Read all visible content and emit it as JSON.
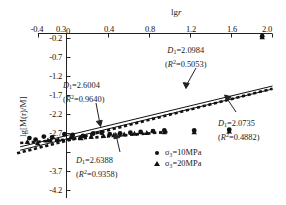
{
  "chart_data": {
    "type": "scatter",
    "title": "",
    "xlabel": "lgr",
    "ylabel": "lg[M(r)/M]",
    "xlim": [
      -0.55,
      2.05
    ],
    "ylim": [
      -4.2,
      -0.2
    ],
    "grid": false,
    "legend_position": "bottom-center-right",
    "xticks": [
      "-0.4",
      "0.3",
      "0",
      "0.4",
      "0.8",
      "1.2",
      "1.6",
      "2.0"
    ],
    "xtick_values": [
      -0.4,
      0.3,
      0.0,
      0.4,
      0.8,
      1.2,
      1.6,
      2.0
    ],
    "yticks": [
      "-0.2",
      "-0.7",
      "-1.2",
      "-1.7",
      "-2.2",
      "-2.7",
      "-3.2",
      "-3.7",
      "-4.2"
    ],
    "ytick_values": [
      -0.2,
      -0.7,
      -1.2,
      -1.7,
      -2.2,
      -2.7,
      -3.2,
      -3.7,
      -4.2
    ],
    "series": [
      {
        "name": "σ₃=10MPa",
        "marker": "circle",
        "points": [
          [
            -0.36,
            -2.82
          ],
          [
            -0.3,
            -2.86
          ],
          [
            -0.22,
            -2.78
          ],
          [
            -0.14,
            -2.8
          ],
          [
            -0.02,
            -2.72
          ],
          [
            0.06,
            -2.74
          ],
          [
            0.16,
            -2.76
          ],
          [
            0.26,
            -2.7
          ],
          [
            0.34,
            -2.68
          ],
          [
            0.42,
            -2.72
          ],
          [
            0.52,
            -2.7
          ],
          [
            0.62,
            -2.68
          ],
          [
            0.72,
            -2.66
          ],
          [
            0.84,
            -2.64
          ],
          [
            0.95,
            -2.62
          ],
          [
            1.24,
            -2.62
          ],
          [
            1.58,
            -2.6
          ],
          [
            1.9,
            -0.14
          ]
        ]
      },
      {
        "name": "σ₃=20MPa",
        "marker": "triangle",
        "points": [
          [
            -0.38,
            -2.92
          ],
          [
            -0.28,
            -2.95
          ],
          [
            -0.18,
            -2.88
          ],
          [
            -0.08,
            -2.86
          ],
          [
            0.04,
            -2.8
          ],
          [
            0.14,
            -2.82
          ],
          [
            0.24,
            -2.78
          ],
          [
            0.36,
            -2.76
          ],
          [
            0.46,
            -2.74
          ],
          [
            0.56,
            -2.72
          ],
          [
            0.66,
            -2.7
          ],
          [
            0.78,
            -2.68
          ],
          [
            0.95,
            -2.66
          ],
          [
            1.24,
            -2.66
          ],
          [
            1.58,
            -2.64
          ],
          [
            1.9,
            -0.16
          ]
        ]
      }
    ],
    "fit_lines": [
      {
        "name": "solid-upper-fit",
        "style": "solid",
        "x": [
          -0.45,
          2.0
        ],
        "y": [
          -3.05,
          -1.45
        ]
      },
      {
        "name": "solid-lower-fit",
        "style": "solid",
        "x": [
          -0.45,
          2.0
        ],
        "y": [
          -3.14,
          -1.53
        ]
      },
      {
        "name": "dashed-fit",
        "style": "dashed",
        "x": [
          -0.48,
          2.0
        ],
        "y": [
          -3.22,
          -1.52
        ]
      },
      {
        "name": "dashed-short-fit",
        "style": "dashed",
        "x": [
          -0.45,
          0.98
        ],
        "y": [
          -2.95,
          -2.66
        ]
      }
    ],
    "annotations": [
      {
        "id": "annot-top-right",
        "line1_prefix": "D",
        "line1_sub": "1",
        "line1_value": "=2.0984",
        "line2": "(R²=0.5053)",
        "r2_prefix": "R",
        "r2_sup": "2",
        "r2_value": "=0.5053"
      },
      {
        "id": "annot-left",
        "line1_prefix": "D",
        "line1_sub": "1",
        "line1_value": "=2.6004",
        "line2": "(R²=0.9640)",
        "r2_prefix": "R",
        "r2_sup": "2",
        "r2_value": "=0.9640"
      },
      {
        "id": "annot-bottom",
        "line1_prefix": "D",
        "line1_sub": "1",
        "line1_value": "=2.6388",
        "line2": "(R²=0.9358)",
        "r2_prefix": "R",
        "r2_sup": "2",
        "r2_value": "=0.9358"
      },
      {
        "id": "annot-right",
        "line1_prefix": "D",
        "line1_sub": "1",
        "line1_value": "=2.0735",
        "line2": "(R²=0.4882)",
        "r2_prefix": "R",
        "r2_sup": "2",
        "r2_value": "=0.4882"
      }
    ]
  },
  "axes": {
    "x_title_lg": "lg",
    "x_title_r": "r",
    "y_title": "lg[M(r)/M]"
  },
  "legend": {
    "items": [
      {
        "marker": "circle-marker",
        "label": "σ₃=10MPa"
      },
      {
        "marker": "triangle-marker",
        "label": "σ₃=20MPa"
      }
    ]
  },
  "colors": {
    "axis": "#222222",
    "marker": "#111111",
    "text": "#1a1a1a"
  }
}
